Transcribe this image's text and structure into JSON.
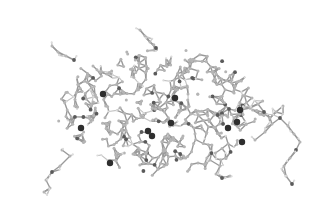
{
  "image": {
    "description": "Grayscale ball-and-stick molecular structure rendering (protein-like) on white background",
    "width": 322,
    "height": 214,
    "background": "#ffffff"
  },
  "colors": {
    "carbon": "#b5b5b5",
    "hydrogen": "#dcdcdc",
    "heteroatom": "#5a5a5a",
    "heavy": "#2e2e2e",
    "bond": "#9a9a9a"
  },
  "molecule": {
    "core_region": {
      "cx": 160,
      "cy": 118,
      "rx": 108,
      "ry": 62
    },
    "branches": [
      {
        "name": "right-tail",
        "points": [
          [
            255,
            140
          ],
          [
            265,
            132
          ],
          [
            272,
            124
          ],
          [
            280,
            118
          ],
          [
            288,
            126
          ],
          [
            294,
            134
          ],
          [
            300,
            142
          ],
          [
            296,
            150
          ],
          [
            290,
            158
          ],
          [
            284,
            166
          ],
          [
            286,
            176
          ],
          [
            292,
            184
          ]
        ]
      },
      {
        "name": "right-upper-tail",
        "points": [
          [
            240,
            110
          ],
          [
            250,
            108
          ],
          [
            258,
            104
          ],
          [
            264,
            112
          ],
          [
            270,
            118
          ],
          [
            276,
            112
          ],
          [
            283,
            106
          ]
        ]
      },
      {
        "name": "lower-left-tail",
        "points": [
          [
            62,
            150
          ],
          [
            70,
            156
          ],
          [
            60,
            166
          ],
          [
            52,
            172
          ],
          [
            46,
            180
          ],
          [
            50,
            188
          ],
          [
            44,
            192
          ]
        ]
      },
      {
        "name": "bottom-center-tail",
        "points": [
          [
            210,
            160
          ],
          [
            220,
            166
          ],
          [
            216,
            174
          ],
          [
            222,
            178
          ],
          [
            230,
            176
          ]
        ]
      },
      {
        "name": "top-tail",
        "points": [
          [
            140,
            30
          ],
          [
            145,
            36
          ],
          [
            150,
            42
          ],
          [
            156,
            48
          ]
        ]
      },
      {
        "name": "left-upper-tail",
        "points": [
          [
            52,
            46
          ],
          [
            58,
            52
          ],
          [
            66,
            56
          ],
          [
            74,
            60
          ]
        ]
      }
    ],
    "heavy_atoms": [
      [
        103,
        94
      ],
      [
        81,
        128
      ],
      [
        148,
        131
      ],
      [
        171,
        123
      ],
      [
        240,
        110
      ],
      [
        228,
        128
      ],
      [
        110,
        163
      ],
      [
        152,
        136
      ],
      [
        242,
        142
      ],
      [
        237,
        122
      ],
      [
        175,
        98
      ]
    ],
    "seed": 7
  }
}
